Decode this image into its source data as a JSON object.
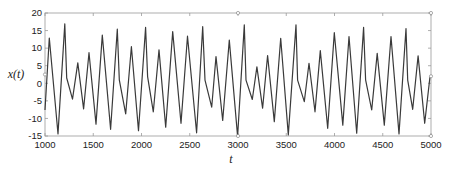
{
  "chart_data": {
    "type": "line",
    "title": "",
    "xlabel": "t",
    "ylabel": "x(t)",
    "xlim": [
      1000,
      5000
    ],
    "ylim": [
      -15,
      20
    ],
    "grid": false,
    "legend": null,
    "xticks": [
      1000,
      1500,
      2000,
      2500,
      3000,
      3500,
      4000,
      4500,
      5000
    ],
    "yticks": [
      -15,
      -10,
      -5,
      0,
      5,
      10,
      15,
      20
    ],
    "series": [
      {
        "name": "x(t)",
        "color": "#3a3a3a",
        "points": [
          [
            1000,
            -7.6
          ],
          [
            1045,
            12.9
          ],
          [
            1135,
            -14.4
          ],
          [
            1205,
            16.9
          ],
          [
            1225,
            1.5
          ],
          [
            1285,
            -4.5
          ],
          [
            1340,
            5.8
          ],
          [
            1400,
            -7.3
          ],
          [
            1456,
            8.7
          ],
          [
            1528,
            -11.6
          ],
          [
            1594,
            13.7
          ],
          [
            1680,
            -13.1
          ],
          [
            1749,
            15.4
          ],
          [
            1770,
            1.0
          ],
          [
            1836,
            -8.7
          ],
          [
            1895,
            10.4
          ],
          [
            1969,
            -13.5
          ],
          [
            2043,
            15.9
          ],
          [
            2063,
            1.9
          ],
          [
            2122,
            -8.1
          ],
          [
            2181,
            9.5
          ],
          [
            2251,
            -12.5
          ],
          [
            2323,
            14.7
          ],
          [
            2409,
            -11.4
          ],
          [
            2477,
            13.4
          ],
          [
            2571,
            -14.1
          ],
          [
            2634,
            16.1
          ],
          [
            2658,
            0.9
          ],
          [
            2727,
            -6.8
          ],
          [
            2772,
            7.6
          ],
          [
            2841,
            -10.6
          ],
          [
            2910,
            12.3
          ],
          [
            2996,
            -15.1
          ],
          [
            3065,
            16.6
          ],
          [
            3083,
            0.9
          ],
          [
            3148,
            -4.6
          ],
          [
            3196,
            4.7
          ],
          [
            3255,
            -7.1
          ],
          [
            3307,
            7.9
          ],
          [
            3376,
            -10.9
          ],
          [
            3442,
            12.8
          ],
          [
            3521,
            -14.7
          ],
          [
            3601,
            16.6
          ],
          [
            3618,
            0.9
          ],
          [
            3687,
            -5.2
          ],
          [
            3736,
            5.7
          ],
          [
            3798,
            -8.1
          ],
          [
            3853,
            9.3
          ],
          [
            3930,
            -12.8
          ],
          [
            3998,
            14.4
          ],
          [
            4086,
            -11.9
          ],
          [
            4150,
            13.3
          ],
          [
            4230,
            -14.2
          ],
          [
            4302,
            15.9
          ],
          [
            4322,
            1.0
          ],
          [
            4385,
            -7.6
          ],
          [
            4443,
            8.5
          ],
          [
            4516,
            -11.9
          ],
          [
            4585,
            13.3
          ],
          [
            4668,
            -14.4
          ],
          [
            4741,
            15.6
          ],
          [
            4759,
            0.9
          ],
          [
            4810,
            -7.4
          ],
          [
            4866,
            7.8
          ],
          [
            4935,
            -11.4
          ],
          [
            4990,
            1.9
          ]
        ]
      }
    ]
  },
  "layout": {
    "plot": {
      "left": 45,
      "top": 13,
      "right": 431,
      "bottom": 136
    },
    "markers": [
      {
        "t": 3000,
        "y": 20
      },
      {
        "t": 3000,
        "y": -15
      },
      {
        "t": 5000,
        "y": 20
      },
      {
        "t": 5000,
        "y": -15
      },
      {
        "t": 5000,
        "y": 2
      },
      {
        "t": 1000,
        "y": 2.5
      }
    ]
  },
  "labels": {
    "xlabel": "t",
    "ylabel": "x(t)"
  }
}
